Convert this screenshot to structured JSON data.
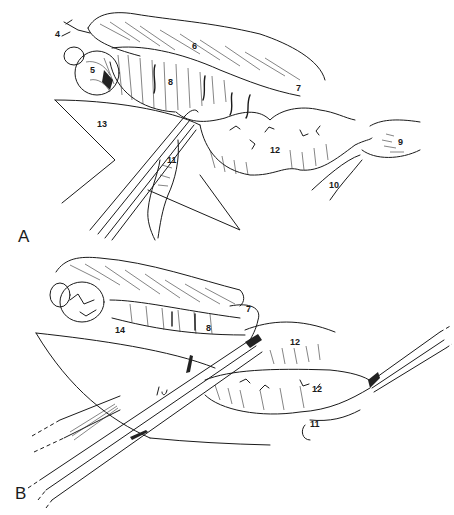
{
  "figure": {
    "panels": [
      {
        "id": "A",
        "label": "A",
        "labels": [
          {
            "id": "4",
            "text": "4",
            "x": 25,
            "y": 28
          },
          {
            "id": "5",
            "text": "5",
            "x": 90,
            "y": 67
          },
          {
            "id": "6",
            "text": "6",
            "x": 192,
            "y": 43
          },
          {
            "id": "7",
            "text": "7",
            "x": 295,
            "y": 84
          },
          {
            "id": "8",
            "text": "8",
            "x": 167,
            "y": 79
          },
          {
            "id": "9",
            "text": "9",
            "x": 398,
            "y": 140
          },
          {
            "id": "10",
            "text": "10",
            "x": 329,
            "y": 182
          },
          {
            "id": "11",
            "text": "11",
            "x": 167,
            "y": 157
          },
          {
            "id": "12",
            "text": "12",
            "x": 270,
            "y": 147
          },
          {
            "id": "13",
            "text": "13",
            "x": 97,
            "y": 120
          }
        ]
      },
      {
        "id": "B",
        "label": "B",
        "labels": [
          {
            "id": "7",
            "text": "7",
            "x": 246,
            "y": 306
          },
          {
            "id": "8",
            "text": "8",
            "x": 206,
            "y": 325
          },
          {
            "id": "12a",
            "text": "12",
            "x": 290,
            "y": 338
          },
          {
            "id": "12b",
            "text": "12",
            "x": 312,
            "y": 386
          },
          {
            "id": "11",
            "text": "11",
            "x": 310,
            "y": 420
          },
          {
            "id": "14",
            "text": "14",
            "x": 115,
            "y": 326
          }
        ]
      }
    ]
  }
}
